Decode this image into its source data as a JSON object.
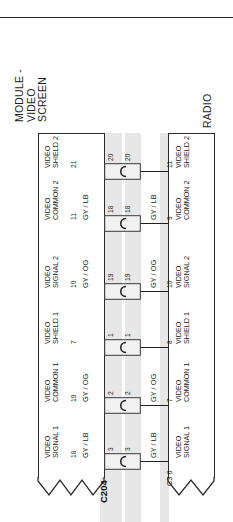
{
  "diagram": {
    "type": "automotive-wiring-harness",
    "orientation": "rotated-90-ccw",
    "top_rule": true,
    "left_device": {
      "title_lines": [
        "MODULE -",
        "VIDEO",
        "SCREEN"
      ],
      "title": "MODULE - VIDEO SCREEN"
    },
    "right_device": {
      "title_lines": [
        "RADIO"
      ],
      "title": "RADIO"
    },
    "connector": {
      "label": "C204",
      "right_label": "C3 6"
    },
    "circuits": [
      {
        "left_pin": "21",
        "left_name_lines": [
          "VIDEO",
          "SHIELD 2"
        ],
        "left_color": "",
        "conn_left_pin": "20",
        "conn_right_pin": "20",
        "right_color": "",
        "right_pin": "11",
        "right_name_lines": [
          "VIDEO",
          "SHIELD 2"
        ]
      },
      {
        "left_pin": "11",
        "left_name_lines": [
          "VIDEO",
          "COMMON 2"
        ],
        "left_color": "GY / LB",
        "conn_left_pin": "18",
        "conn_right_pin": "18",
        "right_color": "GY / LB",
        "right_pin": "9",
        "right_name_lines": [
          "VIDEO",
          "COMMON 2"
        ]
      },
      {
        "left_pin": "10",
        "left_name_lines": [
          "VIDEO",
          "SIGNAL 2"
        ],
        "left_color": "GY / OG",
        "conn_left_pin": "19",
        "conn_right_pin": "19",
        "right_color": "GY / OG",
        "right_pin": "10",
        "right_name_lines": [
          "VIDEO",
          "SIGNAL 2"
        ]
      },
      {
        "left_pin": "7",
        "left_name_lines": [
          "VIDEO",
          "SHIELD 1"
        ],
        "left_color": "",
        "conn_left_pin": "1",
        "conn_right_pin": "1",
        "right_color": "",
        "right_pin": "8",
        "right_name_lines": [
          "VIDEO",
          "SHIELD 1"
        ]
      },
      {
        "left_pin": "19",
        "left_name_lines": [
          "VIDEO",
          "COMMON 1"
        ],
        "left_color": "GY / OG",
        "conn_left_pin": "2",
        "conn_right_pin": "2",
        "right_color": "GY / OG",
        "right_pin": "7",
        "right_name_lines": [
          "VIDEO",
          "COMMON 1"
        ]
      },
      {
        "left_pin": "18",
        "left_name_lines": [
          "VIDEO",
          "SIGNAL 1"
        ],
        "left_color": "GY / LB",
        "conn_left_pin": "3",
        "conn_right_pin": "3",
        "right_color": "GY / LB",
        "right_pin": "6",
        "right_name_lines": [
          "VIDEO",
          "SIGNAL 1"
        ]
      }
    ],
    "colors": {
      "line": "#1f1f1f",
      "band": "#e3e3e3",
      "text": "#1c1c1c",
      "background": "#ffffff"
    }
  }
}
